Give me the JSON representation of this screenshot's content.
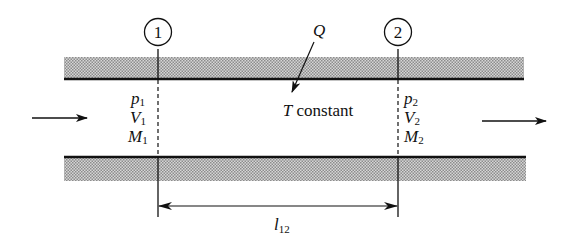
{
  "diagram": {
    "type": "isothermal-duct-flow",
    "stations": [
      {
        "id": "1",
        "label": "1",
        "x": 158,
        "props": [
          {
            "sym": "p",
            "sub": "1"
          },
          {
            "sym": "V",
            "sub": "1"
          },
          {
            "sym": "M",
            "sub": "1"
          }
        ]
      },
      {
        "id": "2",
        "label": "2",
        "x": 398,
        "props": [
          {
            "sym": "p",
            "sub": "2"
          },
          {
            "sym": "V",
            "sub": "2"
          },
          {
            "sym": "M",
            "sub": "2"
          }
        ]
      }
    ],
    "heat_label": "Q",
    "center_label": {
      "italic": "T",
      "rest": " constant"
    },
    "length_label": {
      "sym": "l",
      "sub": "12"
    },
    "colors": {
      "line": "#111111",
      "wall_fill": "#b8b8b8",
      "background": "#ffffff"
    }
  }
}
